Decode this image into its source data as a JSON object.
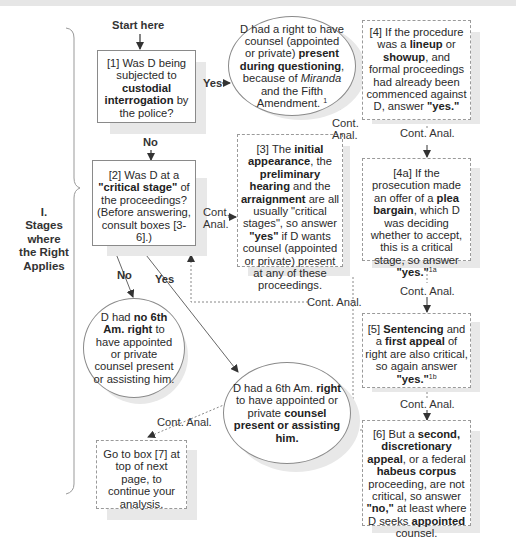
{
  "diagram": {
    "start_label": "Start here",
    "section_label": {
      "numeral": "I.",
      "lines": [
        "Stages where",
        "the Right",
        "Applies"
      ]
    },
    "edge_labels": {
      "yes": "Yes",
      "no": "No",
      "cont_anal": "Cont. Anal.",
      "cont": "Cont.",
      "anal": "Anal."
    },
    "nodes": {
      "box1": {
        "id": "[1]",
        "parts": [
          "Was D being subjected to ",
          "custodial interrogation",
          " by the police?"
        ]
      },
      "ellipse_fifth": {
        "parts": [
          "D had a right to have counsel (appointed or private) ",
          "present during questioning",
          ", because of ",
          "Miranda",
          " and the Fifth Amendment. ",
          "1"
        ]
      },
      "box2": {
        "id": "[2]",
        "parts": [
          "Was D at a ",
          "\"critical stage\"",
          " of the proceedings? (Before answering, consult boxes [3-6].)"
        ]
      },
      "box3": {
        "id": "[3]",
        "parts": [
          "The ",
          "initial appearance",
          ", the ",
          "preliminary hearing",
          " and the ",
          "arraignment",
          " are all usually \"critical stages\", so answer ",
          "\"yes\"",
          " if D wants counsel (appointed or private) present at any of these proceedings."
        ]
      },
      "box4": {
        "id": "[4]",
        "parts": [
          "If the procedure was a ",
          "lineup",
          " or ",
          "showup",
          ", and formal proceedings had already been commenced against D, answer ",
          "\"yes.\""
        ]
      },
      "box4a": {
        "id": "[4a]",
        "parts": [
          "If the prosecution made an offer of a ",
          "plea bargain",
          ", which D was deciding whether to accept, this is a critical stage, so answer ",
          "\"yes.\"",
          "1a"
        ]
      },
      "box5": {
        "id": "[5]",
        "parts": [
          "Sentencing",
          " and a ",
          "first appeal",
          " of right are also critical, so again answer ",
          "\"yes.\"",
          "1b"
        ]
      },
      "box6": {
        "id": "[6]",
        "parts": [
          "But a ",
          "second, discretionary appeal",
          ", or a federal ",
          "habeus corpus",
          " proceeding, are not critical, so answer ",
          "\"no,\"",
          " at least where D seeks ",
          "appointed",
          " counsel."
        ]
      },
      "circle_no": {
        "parts": [
          "D had ",
          "no 6th Am. right",
          " to have appointed or private counsel present or assisting him."
        ]
      },
      "ellipse_yes": {
        "parts": [
          "D had a 6th Am. ",
          "right",
          " to have appointed or private ",
          "counsel present or assisting him."
        ]
      },
      "box7_ref": {
        "parts": [
          "Go to box [7] at top of next page, to continue your analysis."
        ]
      }
    },
    "colors": {
      "line": "#555555",
      "border": "#8a8a8a",
      "shadow": "#e8e8e8",
      "text": "#2a2a2a"
    }
  }
}
